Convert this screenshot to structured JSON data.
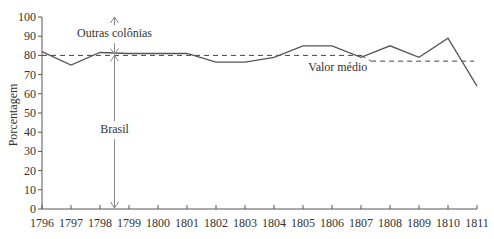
{
  "chart_data": {
    "type": "line",
    "title": "",
    "xlabel": "",
    "ylabel": "Porcentagem",
    "x": [
      1796,
      1797,
      1798,
      1799,
      1800,
      1801,
      1802,
      1803,
      1804,
      1805,
      1806,
      1807,
      1808,
      1809,
      1810,
      1811
    ],
    "xticks": [
      "1796",
      "1797",
      "1798",
      "1799",
      "1800",
      "1801",
      "1802",
      "1803",
      "1804",
      "1805",
      "1806",
      "1807",
      "1808",
      "1809",
      "1810",
      "1811"
    ],
    "yticks": [
      "0",
      "10",
      "20",
      "30",
      "40",
      "50",
      "60",
      "70",
      "80",
      "90",
      "100"
    ],
    "ylim": [
      0,
      100
    ],
    "xlim": [
      1796,
      1811
    ],
    "grid": false,
    "series": [
      {
        "name": "Brasil",
        "values": [
          82,
          75,
          81.5,
          81,
          81,
          81,
          76.5,
          76.5,
          79,
          85,
          85,
          79,
          85,
          79,
          89,
          64
        ]
      }
    ],
    "reference_lines": [
      {
        "name": "Valor médio",
        "style": "dashed",
        "segments": [
          {
            "x": [
              1796,
              1807
            ],
            "y": 80
          },
          {
            "x": [
              1807,
              1807.35
            ],
            "y": [
              80,
              77
            ]
          },
          {
            "x": [
              1807.35,
              1810.9
            ],
            "y": 77
          }
        ]
      }
    ],
    "annotations": [
      {
        "text": "Outras colônias",
        "type": "double-arrow",
        "x": 1798.5,
        "y_range": [
          80,
          100
        ]
      },
      {
        "text": "Brasil",
        "type": "double-arrow",
        "x": 1798.5,
        "y_range": [
          0,
          80
        ]
      },
      {
        "text": "Valor médio",
        "type": "label",
        "x": 1806.2,
        "y": 78
      }
    ]
  }
}
